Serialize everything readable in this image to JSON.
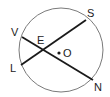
{
  "diagram": {
    "circle": {
      "center_label": "O",
      "cx": 61,
      "cy": 50,
      "r": 42,
      "stroke": "#7a7a7a"
    },
    "chords": [
      {
        "name": "LS",
        "from": "L",
        "to": "S"
      },
      {
        "name": "VN",
        "from": "V",
        "to": "N"
      }
    ],
    "points": {
      "V": {
        "label": "V",
        "x": 22,
        "y": 37
      },
      "S": {
        "label": "S",
        "x": 86,
        "y": 20
      },
      "L": {
        "label": "L",
        "x": 21,
        "y": 65
      },
      "N": {
        "label": "N",
        "x": 93,
        "y": 80
      },
      "E": {
        "label": "E",
        "x": 43,
        "y": 49
      },
      "O": {
        "label": "O",
        "x": 59,
        "y": 53
      }
    },
    "line_color": "#1a1a1a"
  }
}
